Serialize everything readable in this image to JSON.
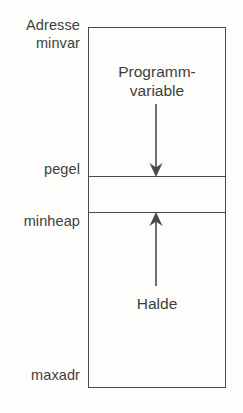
{
  "diagram": {
    "language": "de",
    "axis_labels": [
      {
        "name": "address-header",
        "text": "Adresse\nminvar"
      },
      {
        "name": "pegel",
        "text": "pegel"
      },
      {
        "name": "minheap",
        "text": "minheap"
      },
      {
        "name": "maxadr",
        "text": "maxadr"
      }
    ],
    "regions": [
      {
        "name": "program-variables",
        "text": "Programm-\nvariable",
        "arrow": "down"
      },
      {
        "name": "free-space",
        "text": "",
        "arrow": "none"
      },
      {
        "name": "heap",
        "text": "Halde",
        "arrow": "up"
      }
    ],
    "colors": {
      "line": "#4a4a4a",
      "text": "#3d3d3d",
      "background": "#fdfdfb"
    }
  }
}
